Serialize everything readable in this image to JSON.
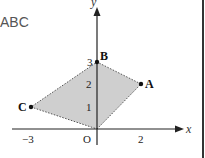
{
  "prefix_text": "ABC",
  "axes": {
    "x_label": "x",
    "y_label": "y",
    "origin_label": "O"
  },
  "x_ticks": [
    {
      "value": -3,
      "label": "−3"
    },
    {
      "value": 2,
      "label": "2"
    }
  ],
  "y_ticks": [
    {
      "value": 1,
      "label": "1"
    },
    {
      "value": 2,
      "label": "2"
    },
    {
      "value": 3,
      "label": "3"
    }
  ],
  "points": [
    {
      "name": "A",
      "x": 2,
      "y": 2
    },
    {
      "name": "B",
      "x": 0,
      "y": 3
    },
    {
      "name": "C",
      "x": -3,
      "y": 1
    },
    {
      "name": "O",
      "x": 0,
      "y": 0
    }
  ],
  "polygon": {
    "vertices": [
      "O",
      "A",
      "B",
      "C"
    ],
    "fill": "#cfcfcf",
    "edge_style": "dotted"
  }
}
